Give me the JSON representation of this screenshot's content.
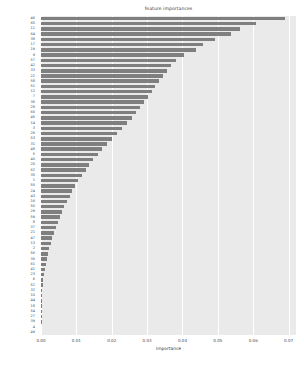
{
  "chart_data": {
    "type": "bar",
    "orientation": "horizontal",
    "title": "feature importances",
    "xlabel": "importance",
    "ylabel": "",
    "xlim": [
      0.0,
      0.0721
    ],
    "xticks": [
      0.0,
      0.01,
      0.02,
      0.03,
      0.04,
      0.05,
      0.06,
      0.07
    ],
    "xtick_labels": [
      "0.00",
      "0.01",
      "0.02",
      "0.03",
      "0.04",
      "0.05",
      "0.06",
      "0.07"
    ],
    "grid": "vertical-white-on-gray",
    "legend": "none",
    "bar_color": "#7f7f7f",
    "panel_color": "#eaeaea",
    "categories": [
      "46",
      "65",
      "11",
      "64",
      "38",
      "17",
      "19",
      "9",
      "57",
      "42",
      "33",
      "22",
      "58",
      "51",
      "12",
      "7",
      "36",
      "28",
      "60",
      "45",
      "14",
      "3",
      "26",
      "53",
      "31",
      "48",
      "5",
      "40",
      "20",
      "62",
      "35",
      "1",
      "55",
      "24",
      "43",
      "16",
      "50",
      "29",
      "59",
      "8",
      "37",
      "21",
      "47",
      "13",
      "2",
      "56",
      "30",
      "61",
      "41",
      "23",
      "6",
      "52",
      "32",
      "10",
      "44",
      "18",
      "54",
      "27",
      "39",
      "4",
      "49"
    ],
    "values": [
      0.069,
      0.0609,
      0.0562,
      0.0537,
      0.0491,
      0.0458,
      0.0438,
      0.0404,
      0.0383,
      0.0368,
      0.0356,
      0.0345,
      0.0333,
      0.0323,
      0.0313,
      0.0303,
      0.0292,
      0.028,
      0.0269,
      0.0257,
      0.0242,
      0.0228,
      0.0215,
      0.02,
      0.0187,
      0.0173,
      0.016,
      0.0148,
      0.0137,
      0.0126,
      0.0116,
      0.0106,
      0.0097,
      0.0089,
      0.0081,
      0.0073,
      0.0066,
      0.0059,
      0.0053,
      0.0047,
      0.0041,
      0.0036,
      0.0031,
      0.0027,
      0.0023,
      0.0019,
      0.0016,
      0.0013,
      0.001,
      0.0008,
      0.0006,
      0.0005,
      0.0004,
      0.0003,
      0.0002,
      0.0002,
      0.0001,
      0.0001,
      0.0001,
      0.0,
      0.0
    ]
  }
}
